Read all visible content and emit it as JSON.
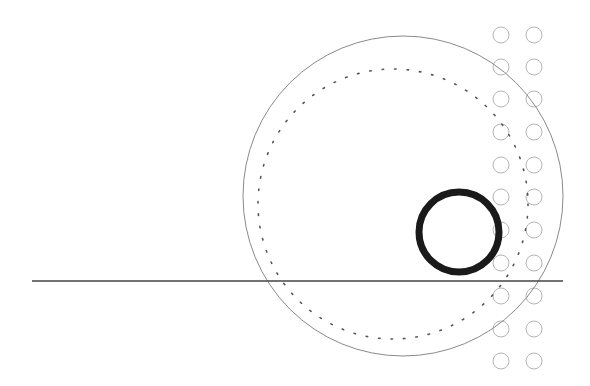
{
  "diagram": {
    "width": 590,
    "height": 386,
    "background": "#ffffff",
    "ground_line": {
      "x1": 32,
      "y1": 281,
      "x2": 563,
      "y2": 281,
      "color": "#444444",
      "stroke_width": 1.3
    },
    "outer_circle": {
      "cx": 403,
      "cy": 196,
      "r": 160,
      "color": "#8a8a8a",
      "stroke_width": 1
    },
    "dotted_circle": {
      "cx": 393,
      "cy": 204,
      "r": 135,
      "color": "#555555",
      "stroke_width": 1.6,
      "dash": "1.5 11"
    },
    "thick_circle": {
      "cx": 459,
      "cy": 232,
      "r": 40,
      "color": "#1a1a1a",
      "stroke_width": 7
    },
    "small_circles": {
      "color": "#b5b5b5",
      "stroke_width": 1,
      "r": 8,
      "columns_x": [
        501,
        534
      ],
      "rows_y": [
        35,
        67,
        99,
        132,
        165,
        197,
        230,
        263,
        296,
        329,
        361
      ]
    }
  }
}
